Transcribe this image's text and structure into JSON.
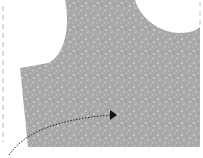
{
  "diagram": {
    "type": "sewing-pattern-piece",
    "colors": {
      "fabric": "#a8a8a8",
      "speckle_light": "#cfcfcf",
      "speckle_dark": "#8f8f8f",
      "background": "#ffffff",
      "dashed_line": "#b5b5b5",
      "arrow": "#222222"
    },
    "elements": [
      {
        "name": "fabric-piece",
        "description": "speckled gray fabric with curved cutouts"
      },
      {
        "name": "fold-line",
        "description": "dashed vertical line at left edge"
      },
      {
        "name": "seam-arrow",
        "description": "dotted curved arrow pointing right"
      }
    ]
  }
}
